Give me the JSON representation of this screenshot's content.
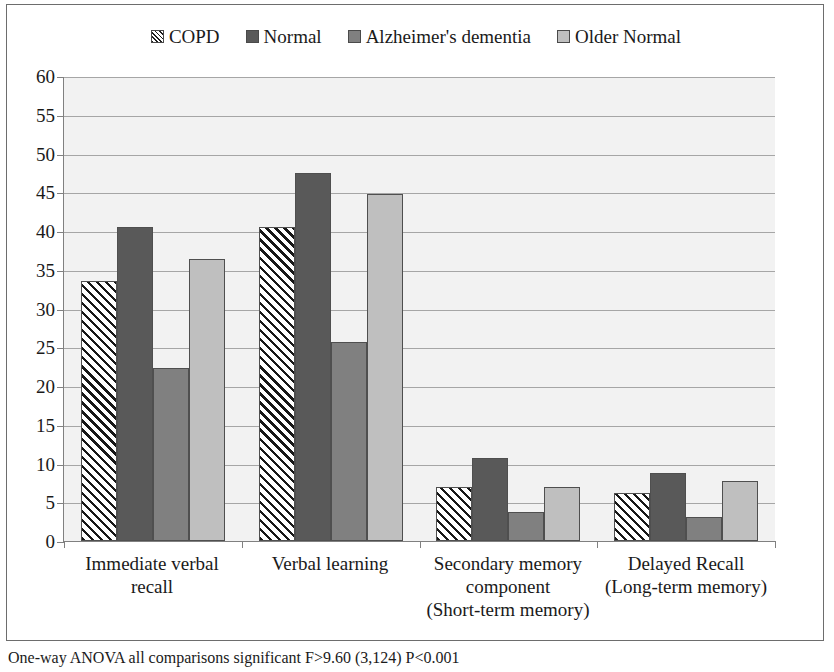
{
  "chart_data": {
    "type": "bar",
    "title": "",
    "xlabel": "",
    "ylabel": "",
    "ylim": [
      0,
      60
    ],
    "ytick_step": 5,
    "yticks": [
      60,
      55,
      50,
      45,
      40,
      35,
      30,
      25,
      20,
      15,
      10,
      5,
      0
    ],
    "grid": true,
    "legend_position": "top-center",
    "categories": [
      "Immediate verbal recall",
      "Verbal learning",
      "Secondary memory component (Short-term memory)",
      "Delayed Recall (Long-term memory)"
    ],
    "category_lines": [
      [
        "Immediate verbal",
        "recall"
      ],
      [
        "Verbal learning"
      ],
      [
        "Secondary memory",
        "component",
        "(Short-term memory)"
      ],
      [
        "Delayed Recall",
        "(Long-term memory)"
      ]
    ],
    "series": [
      {
        "name": "COPD",
        "fill": "diagonal-hatch",
        "color": "#ffffff",
        "values": [
          33.5,
          40.5,
          7.0,
          6.2
        ]
      },
      {
        "name": "Normal",
        "fill": "solid",
        "color": "#595959",
        "values": [
          40.5,
          47.5,
          10.7,
          8.8
        ]
      },
      {
        "name": "Alzheimer's dementia",
        "fill": "solid",
        "color": "#808080",
        "values": [
          22.3,
          25.7,
          3.7,
          3.1
        ]
      },
      {
        "name": "Older Normal",
        "fill": "solid",
        "color": "#bfbfbf",
        "values": [
          36.4,
          44.8,
          7.0,
          7.7
        ]
      }
    ],
    "annotations": [
      "One-way ANOVA all comparisons significant F>9.60 (3,124) P<0.001"
    ]
  },
  "legend": {
    "items": [
      {
        "label": "COPD",
        "swatch": "hatch-swatch-icon"
      },
      {
        "label": "Normal",
        "swatch": "dark-gray-swatch-icon"
      },
      {
        "label": "Alzheimer's dementia",
        "swatch": "mid-gray-swatch-icon"
      },
      {
        "label": "Older Normal",
        "swatch": "light-gray-swatch-icon"
      }
    ]
  },
  "caption": {
    "text": "One-way ANOVA all comparisons significant F>9.60 (3,124) P<0.001"
  },
  "colors": {
    "plot_background": "#f2f2f2",
    "gridline": "#a6a6a6",
    "axis": "#808080",
    "frame": "#6d6d6d",
    "series_normal": "#595959",
    "series_alzheimers": "#808080",
    "series_older_normal": "#bfbfbf"
  }
}
